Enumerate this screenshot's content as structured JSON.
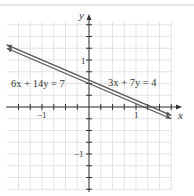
{
  "figure": {
    "axes": {
      "x_label": "x",
      "y_label": "y",
      "x_tick_labels": [
        {
          "value": -1,
          "text": "−1"
        },
        {
          "value": 1,
          "text": "1"
        }
      ],
      "y_tick_labels": [
        {
          "value": 1,
          "text": "1"
        },
        {
          "value": -1,
          "text": "−1"
        }
      ],
      "xlim": [
        -1.75,
        2.0
      ],
      "ylim": [
        -1.75,
        2.0
      ],
      "tick_step": 0.25,
      "grid": true
    },
    "equations": [
      {
        "id": "eq1",
        "text": "6x + 14y = 7",
        "a": 6,
        "b": 14,
        "c": 7
      },
      {
        "id": "eq2",
        "text": "3x + 7y = 4",
        "a": 3,
        "b": 7,
        "c": 4
      }
    ],
    "colors": {
      "grid": "#d9d9d9",
      "axis": "#333333",
      "line": "#555555",
      "top_rule": "#cccccc"
    }
  }
}
